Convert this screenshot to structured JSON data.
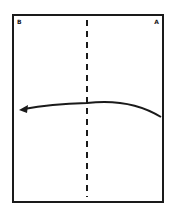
{
  "diagram": {
    "type": "paper-folding-instruction",
    "paper": {
      "shape": "rectangle",
      "corner_labels": {
        "top_left": "B",
        "top_right": "A"
      }
    },
    "fold_line": {
      "style": "dashed",
      "orientation": "vertical",
      "position": "center"
    },
    "arrow": {
      "direction": "right-to-left",
      "shape": "curved",
      "meaning": "fold right half over to the left"
    },
    "colors": {
      "line": "#1a1a1a",
      "background": "#ffffff"
    }
  }
}
